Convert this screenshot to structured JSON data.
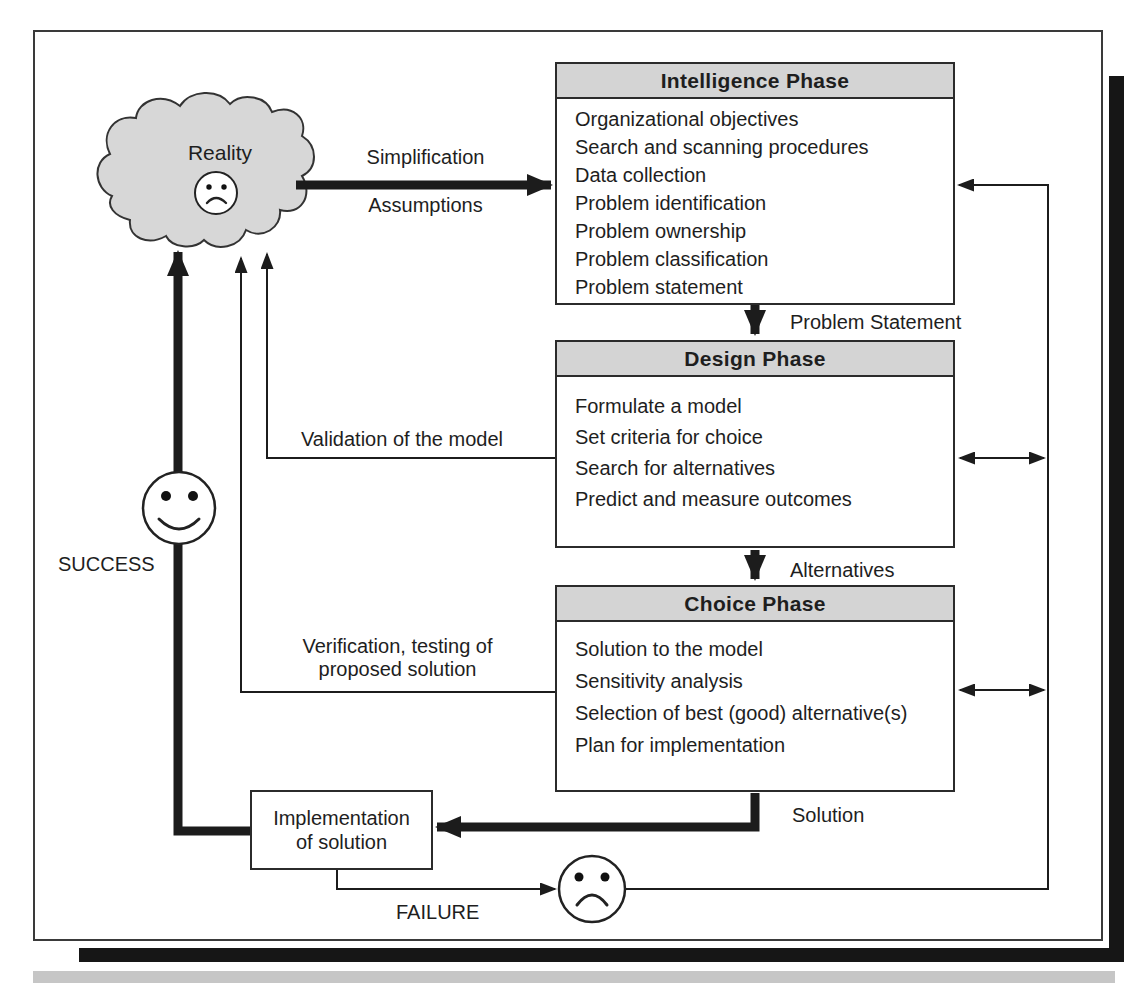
{
  "diagram": {
    "cloud_label": "Reality",
    "flow_labels": {
      "simplification": "Simplification",
      "assumptions": "Assumptions",
      "problem_statement": "Problem Statement",
      "alternatives": "Alternatives",
      "solution": "Solution",
      "validation": "Validation of the model",
      "verification_line1": "Verification, testing of",
      "verification_line2": "proposed solution",
      "success": "SUCCESS",
      "failure": "FAILURE"
    },
    "phases": [
      {
        "title": "Intelligence Phase",
        "items": [
          "Organizational objectives",
          "Search and scanning procedures",
          "Data collection",
          "Problem identification",
          "Problem ownership",
          "Problem classification",
          "Problem statement"
        ]
      },
      {
        "title": "Design Phase",
        "items": [
          "Formulate a model",
          "Set criteria for choice",
          "Search for alternatives",
          "Predict and measure outcomes"
        ]
      },
      {
        "title": "Choice Phase",
        "items": [
          "Solution to the model",
          "Sensitivity analysis",
          "Selection of best (good) alternative(s)",
          "Plan for implementation"
        ]
      }
    ],
    "implementation_box": {
      "line1": "Implementation",
      "line2": "of solution"
    },
    "colors": {
      "phase_header_fill": "#d4d4d4",
      "cloud_fill": "#d7d7d7",
      "line": "#1c1c1c",
      "shadow": "#161616",
      "bottom_band": "#c6c6c6"
    }
  }
}
